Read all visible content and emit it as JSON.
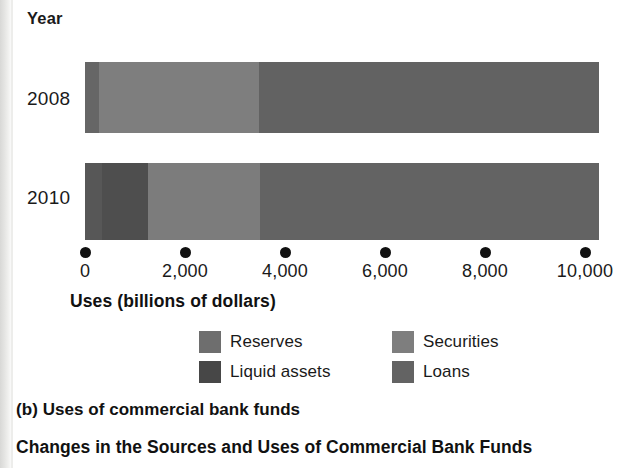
{
  "figure": {
    "panel_caption": "(b) Uses of commercial bank funds",
    "title": "Changes in the Sources and Uses of Commercial Bank Funds",
    "axis_title": "Uses (billions of dollars)",
    "year_header": "Year"
  },
  "chart_data": {
    "type": "bar",
    "orientation": "horizontal",
    "stacked": true,
    "title": "Changes in the Sources and Uses of Commercial Bank Funds",
    "subtitle": "(b) Uses of commercial bank funds",
    "xlabel": "Uses (billions of dollars)",
    "ylabel": "Year",
    "categories": [
      "2008",
      "2010"
    ],
    "xlim": [
      0,
      10600
    ],
    "xticks": [
      0,
      2000,
      4000,
      6000,
      8000,
      10000
    ],
    "xtick_labels": [
      "0",
      "2,000",
      "4,000",
      "6,000",
      "8,000",
      "10,000"
    ],
    "grid": false,
    "legend_position": "bottom",
    "series": [
      {
        "name": "Reserves",
        "color": "#6e6e6e",
        "values": [
          280,
          340
        ]
      },
      {
        "name": "Liquid assets",
        "color": "#4a4a4a",
        "values": [
          0,
          920
        ]
      },
      {
        "name": "Securities",
        "color": "#808080",
        "values": [
          3200,
          2240
        ]
      },
      {
        "name": "Loans",
        "color": "#636363",
        "values": [
          6800,
          6780
        ]
      }
    ],
    "totals": [
      10280,
      10280
    ]
  },
  "bars": [
    {
      "year": "2008",
      "segments": [
        {
          "name": "Reserves",
          "start": 0,
          "end": 280,
          "color": "#666666"
        },
        {
          "name": "Liquid assets",
          "start": 280,
          "end": 280,
          "color": "#474747"
        },
        {
          "name": "Securities",
          "start": 280,
          "end": 3480,
          "color": "#7e7e7e"
        },
        {
          "name": "Loans",
          "start": 3480,
          "end": 10280,
          "color": "#626262"
        }
      ]
    },
    {
      "year": "2010",
      "segments": [
        {
          "name": "Reserves",
          "start": 0,
          "end": 340,
          "color": "#575757"
        },
        {
          "name": "Liquid assets",
          "start": 340,
          "end": 1260,
          "color": "#4e4e4e"
        },
        {
          "name": "Securities",
          "start": 1260,
          "end": 3500,
          "color": "#7c7c7c"
        },
        {
          "name": "Loans",
          "start": 3500,
          "end": 10280,
          "color": "#636363"
        }
      ]
    }
  ],
  "axis": {
    "ticks": [
      {
        "value": 0,
        "label": "0"
      },
      {
        "value": 2000,
        "label": "2,000"
      },
      {
        "value": 4000,
        "label": "4,000"
      },
      {
        "value": 6000,
        "label": "6,000"
      },
      {
        "value": 8000,
        "label": "8,000"
      },
      {
        "value": 10000,
        "label": "10,000"
      }
    ]
  },
  "legend": {
    "items": [
      {
        "label": "Reserves",
        "color": "#6e6e6e",
        "col": 0,
        "row": 0
      },
      {
        "label": "Securities",
        "color": "#7e7e7e",
        "col": 1,
        "row": 0
      },
      {
        "label": "Liquid assets",
        "color": "#474747",
        "col": 0,
        "row": 1
      },
      {
        "label": "Loans",
        "color": "#636363",
        "col": 1,
        "row": 1
      }
    ]
  }
}
